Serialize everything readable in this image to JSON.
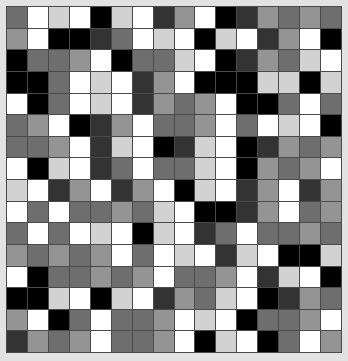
{
  "figure": {
    "background_color": "#e2e2e2",
    "gridline_color": "#4a4a4a",
    "border_color": "#4a4a4a"
  },
  "chart_data": {
    "type": "heatmap",
    "title": "",
    "subtitle": "",
    "xlabel": "",
    "ylabel": "",
    "grid": true,
    "legend": false,
    "legend_position": "none",
    "colormap": "grayscale",
    "rows": 16,
    "cols": 16,
    "x": [
      1,
      2,
      3,
      4,
      5,
      6,
      7,
      8,
      9,
      10,
      11,
      12,
      13,
      14,
      15,
      16
    ],
    "y": [
      1,
      2,
      3,
      4,
      5,
      6,
      7,
      8,
      9,
      10,
      11,
      12,
      13,
      14,
      15,
      16
    ],
    "xticklabels": [],
    "yticklabels": [],
    "vmin": 0,
    "vmax": 5,
    "level_colors": [
      "#000000",
      "#333333",
      "#6e6e6e",
      "#949494",
      "#d2d2d2",
      "#ffffff"
    ],
    "level_names": [
      "black",
      "dark-gray",
      "mid-gray",
      "light-gray",
      "near-white",
      "white"
    ],
    "values": [
      [
        2,
        5,
        4,
        5,
        0,
        4,
        5,
        1,
        3,
        5,
        0,
        1,
        3,
        2,
        3,
        2
      ],
      [
        3,
        5,
        0,
        0,
        1,
        2,
        5,
        4,
        5,
        0,
        4,
        5,
        1,
        3,
        5,
        0
      ],
      [
        0,
        2,
        2,
        3,
        5,
        0,
        2,
        2,
        4,
        5,
        0,
        1,
        3,
        2,
        4,
        5
      ],
      [
        0,
        0,
        2,
        5,
        4,
        5,
        1,
        3,
        5,
        0,
        0,
        0,
        4,
        4,
        0,
        4
      ],
      [
        5,
        0,
        2,
        5,
        4,
        5,
        1,
        3,
        2,
        3,
        5,
        0,
        0,
        2,
        5,
        2
      ],
      [
        2,
        3,
        5,
        0,
        1,
        3,
        5,
        2,
        2,
        3,
        5,
        2,
        5,
        4,
        5,
        0
      ],
      [
        2,
        2,
        3,
        5,
        1,
        4,
        5,
        0,
        1,
        4,
        5,
        0,
        1,
        3,
        2,
        3
      ],
      [
        5,
        0,
        4,
        5,
        1,
        2,
        5,
        2,
        2,
        4,
        5,
        0,
        3,
        2,
        3,
        5
      ],
      [
        4,
        5,
        1,
        3,
        5,
        1,
        3,
        5,
        0,
        4,
        5,
        1,
        3,
        5,
        1,
        3
      ],
      [
        5,
        2,
        5,
        2,
        2,
        3,
        2,
        4,
        5,
        0,
        0,
        1,
        3,
        5,
        2,
        3
      ],
      [
        2,
        5,
        2,
        5,
        4,
        5,
        0,
        4,
        5,
        1,
        2,
        5,
        2,
        2,
        3,
        2
      ],
      [
        3,
        2,
        3,
        2,
        3,
        5,
        2,
        5,
        4,
        5,
        1,
        4,
        5,
        0,
        0,
        4
      ],
      [
        5,
        0,
        2,
        2,
        3,
        2,
        3,
        5,
        2,
        2,
        3,
        5,
        1,
        4,
        5,
        0
      ],
      [
        0,
        0,
        4,
        5,
        0,
        4,
        5,
        1,
        3,
        2,
        4,
        5,
        0,
        1,
        3,
        2
      ],
      [
        3,
        5,
        0,
        2,
        5,
        2,
        2,
        3,
        5,
        4,
        5,
        0,
        2,
        2,
        3,
        5
      ],
      [
        1,
        3,
        2,
        3,
        5,
        2,
        2,
        3,
        5,
        0,
        4,
        5,
        0,
        2,
        5,
        3
      ]
    ]
  }
}
